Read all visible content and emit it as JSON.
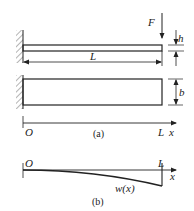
{
  "figure": {
    "part_a": {
      "caption": "(a)",
      "force_label": "F",
      "length_label": "L",
      "height_label": "h",
      "width_label": "b",
      "origin_label": "O",
      "end_label": "L",
      "axis_label": "x"
    },
    "part_b": {
      "caption": "(b)",
      "origin_label": "O",
      "end_label": "L",
      "axis_label": "x",
      "curve_label": "w(x)"
    },
    "colors": {
      "stroke": "#222222",
      "background": "#ffffff"
    }
  }
}
